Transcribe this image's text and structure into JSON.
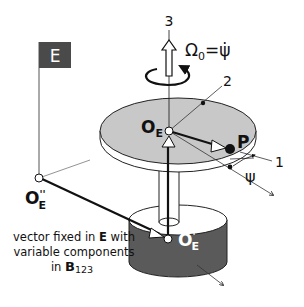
{
  "diagram": {
    "frame_flag": {
      "label": "E",
      "color": "#4a4a4a"
    },
    "axes": {
      "axis_3": "3",
      "axis_2": "2",
      "axis_1": "1"
    },
    "angular_velocity": {
      "omega": "Ω",
      "omega_sub": "0",
      "equals": "=",
      "psi_dot": "ψ̇"
    },
    "points": {
      "O_E": {
        "main": "O",
        "sub": "E"
      },
      "O_E_prime": {
        "main": "O",
        "prime": "'",
        "sub": "E"
      },
      "O_E_double_prime": {
        "main": "O",
        "prime": "''",
        "sub": "E"
      },
      "P": "P"
    },
    "angle_label": "ψ",
    "annotation": {
      "line1_pre": "vector fixed in ",
      "line1_bold": "E",
      "line1_post": " with",
      "line2": "variable components",
      "line3_pre": "in ",
      "line3_bold": "B",
      "line3_sub": "123"
    },
    "colors": {
      "disk_top": "#c8c8c8",
      "base_side": "#5a5a5a",
      "base_top": "#ffffff",
      "flag": "#4a4a4a",
      "line": "#111111"
    }
  }
}
